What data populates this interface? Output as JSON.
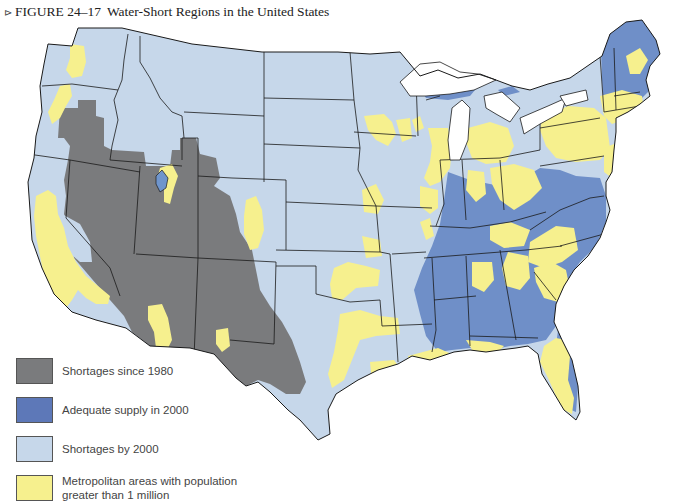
{
  "figure": {
    "marker": "⊳",
    "number": "FIGURE 24–17",
    "title": "Water-Short Regions in the United States"
  },
  "colors": {
    "shortages_since_1980": "#7a7b7d",
    "adequate_supply_2000": "#6f8fc8",
    "shortages_by_2000": "#c6d7ea",
    "metro_areas": "#f6f08e",
    "borders": "#1a1a1a",
    "water": "#ffffff"
  },
  "legend": {
    "items": [
      {
        "label": "Shortages since 1980",
        "color": "#7a7b7d"
      },
      {
        "label": "Adequate supply in 2000",
        "color": "#5d78b8"
      },
      {
        "label": "Shortages by 2000",
        "color": "#c6d7ea"
      },
      {
        "label": "Metropolitan areas with population greater than 1 million",
        "color": "#f6f08e"
      }
    ]
  },
  "map": {
    "region": "United States (contiguous)",
    "categories": [
      {
        "name": "Shortages since 1980",
        "areas": [
          "Nevada",
          "Utah",
          "Arizona",
          "New Mexico",
          "Colorado (west/central)",
          "Wyoming (south)",
          "Idaho (south)",
          "Oregon (southeast)",
          "West Texas",
          "Southeastern California interior"
        ]
      },
      {
        "name": "Adequate supply in 2000",
        "areas": [
          "Maine",
          "New Hampshire",
          "Vermont",
          "Upper Michigan",
          "Indiana",
          "Ohio Valley",
          "Kentucky",
          "Tennessee",
          "Mississippi",
          "Alabama",
          "Georgia",
          "Carolinas",
          "Florida interior",
          "West Virginia"
        ]
      },
      {
        "name": "Shortages by 2000",
        "areas": [
          "Pacific Northwest",
          "Montana",
          "Dakotas",
          "Nebraska",
          "Kansas",
          "Oklahoma",
          "Texas",
          "Minnesota",
          "Iowa",
          "Missouri",
          "Arkansas",
          "Louisiana"
        ]
      },
      {
        "name": "Metropolitan areas with population greater than 1 million",
        "areas": [
          "Seattle",
          "Portland",
          "San Francisco Bay",
          "Los Angeles",
          "San Diego",
          "Salt Lake City",
          "Denver",
          "Phoenix",
          "Tucson",
          "Dallas–Fort Worth",
          "Houston",
          "San Antonio",
          "New Orleans",
          "Minneapolis",
          "Chicago",
          "Detroit",
          "Atlanta",
          "Florida",
          "Northeast corridor"
        ]
      }
    ]
  }
}
